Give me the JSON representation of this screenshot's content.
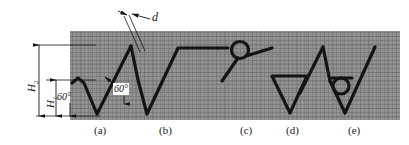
{
  "figure": {
    "type": "engineering-profile-diagram",
    "background_texture": "cross-hatched-grey-metallurgical-section",
    "line_color": "#141414",
    "texture_color": "#8d8d8d",
    "plate": {
      "x": 70,
      "y": 31,
      "width": 330,
      "height": 89
    }
  },
  "dimensions": {
    "h2": {
      "label": "H",
      "subscript": "2",
      "value_text": "H2",
      "orientation": "vertical",
      "from_y": 45,
      "to_y": 116
    },
    "h1": {
      "label": "H",
      "subscript": "1",
      "value_text": "H1",
      "orientation": "vertical",
      "from_y": 80,
      "to_y": 116
    },
    "d": {
      "label": "d",
      "value_text": "d",
      "orientation": "diagonal",
      "description": "crack-width-gap"
    },
    "angle_left": {
      "value_text": "60°"
    },
    "angle_center": {
      "value_text": "60°"
    }
  },
  "captions": [
    {
      "key": "a",
      "text": "(a)",
      "x": 94,
      "y": 125
    },
    {
      "key": "b",
      "text": "(b)",
      "x": 159,
      "y": 125
    },
    {
      "key": "c",
      "text": "(c)",
      "x": 240,
      "y": 125
    },
    {
      "key": "d",
      "text": "(d)",
      "x": 286,
      "y": 125
    },
    {
      "key": "e",
      "text": "(e)",
      "x": 348,
      "y": 125
    }
  ],
  "profiles": [
    {
      "key": "a",
      "name": "shallow-v-notch",
      "description": "small V notch of depth H1 with 60 degree included angle"
    },
    {
      "key": "b",
      "name": "deep-v-notch",
      "description": "deep V notch of depth H2 with 60 degree included angle and flat crest"
    },
    {
      "key": "c",
      "name": "loop-crest-notch",
      "description": "notch terminating in a circular loop at the crest"
    },
    {
      "key": "d",
      "name": "closed-triangle-notch",
      "description": "V notch closed by a horizontal chord forming a triangle"
    },
    {
      "key": "e",
      "name": "loop-root-notch",
      "description": "V notch with small circular loop at the upper left flank"
    }
  ]
}
